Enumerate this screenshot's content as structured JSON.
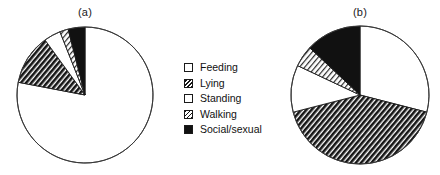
{
  "figure": {
    "panels": [
      {
        "id": "a",
        "label": "(a)"
      },
      {
        "id": "b",
        "label": "(b)"
      }
    ]
  },
  "legend": {
    "items": [
      {
        "label": "Feeding",
        "pattern": "white",
        "color": "#ffffff"
      },
      {
        "label": "Lying",
        "pattern": "dark-hatch",
        "color": "#1a1a1a"
      },
      {
        "label": "Standing",
        "pattern": "white",
        "color": "#ffffff"
      },
      {
        "label": "Walking",
        "pattern": "light-hatch",
        "color": "#9a9a9a"
      },
      {
        "label": "Social/sexual",
        "pattern": "solid-black",
        "color": "#111111"
      }
    ]
  },
  "chart_data": [
    {
      "type": "pie",
      "title": "(a)",
      "labels": [
        "Feeding",
        "Lying",
        "Standing",
        "Walking",
        "Social/sexual"
      ],
      "values": [
        78,
        12,
        4,
        2,
        4
      ],
      "units": "percent",
      "start_angle": 0,
      "direction": "clockwise",
      "patterns": [
        "white",
        "dark-hatch",
        "white",
        "light-hatch",
        "solid-black"
      ],
      "legend_position": "center"
    },
    {
      "type": "pie",
      "title": "(b)",
      "labels": [
        "Feeding",
        "Lying",
        "Standing",
        "Walking",
        "Social/sexual"
      ],
      "values": [
        29,
        42,
        11,
        5,
        13
      ],
      "units": "percent",
      "start_angle": 0,
      "direction": "clockwise",
      "patterns": [
        "white",
        "dark-hatch",
        "white",
        "light-hatch",
        "solid-black"
      ],
      "legend_position": "center"
    }
  ]
}
